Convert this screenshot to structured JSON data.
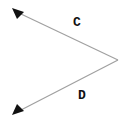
{
  "diagram": {
    "type": "angle-with-rays",
    "vertex": {
      "x": 118,
      "y": 60
    },
    "rays": [
      {
        "label": "C",
        "end": {
          "x": 17,
          "y": 12
        },
        "arrowhead": "triangle"
      },
      {
        "label": "D",
        "end": {
          "x": 17,
          "y": 112
        },
        "arrowhead": "triangle"
      }
    ],
    "labels": {
      "c": "C",
      "d": "D"
    },
    "colors": {
      "line": "#a0a0a0",
      "arrowhead": "#111111",
      "label": "#111111",
      "background": "#ffffff"
    }
  }
}
